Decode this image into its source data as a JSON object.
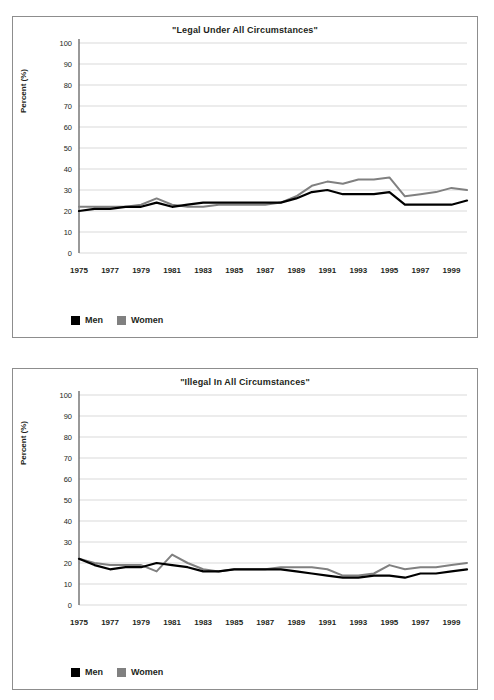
{
  "figure": {
    "panels": [
      {
        "id": "legal",
        "title": "\"Legal Under All Circumstances\"",
        "ylabel": "Percent (%)",
        "legend": [
          {
            "name": "Men",
            "color": "#000000"
          },
          {
            "name": "Women",
            "color": "#808080"
          }
        ],
        "yticks": [
          "0",
          "10",
          "20",
          "30",
          "40",
          "50",
          "60",
          "70",
          "80",
          "90",
          "100"
        ],
        "xticks": [
          "1975",
          "1977",
          "1979",
          "1981",
          "1983",
          "1985",
          "1987",
          "1989",
          "1991",
          "1993",
          "1995",
          "1997",
          "1999"
        ]
      },
      {
        "id": "illegal",
        "title": "\"Illegal In All Circumstances\"",
        "ylabel": "Percent (%)",
        "legend": [
          {
            "name": "Men",
            "color": "#000000"
          },
          {
            "name": "Women",
            "color": "#808080"
          }
        ],
        "yticks": [
          "0",
          "10",
          "20",
          "30",
          "40",
          "50",
          "60",
          "70",
          "80",
          "90",
          "100"
        ],
        "xticks": [
          "1975",
          "1977",
          "1979",
          "1981",
          "1983",
          "1985",
          "1987",
          "1989",
          "1991",
          "1993",
          "1995",
          "1997",
          "1999"
        ]
      }
    ]
  },
  "chart_data": [
    {
      "type": "line",
      "title": "\"Legal Under All Circumstances\"",
      "xlabel": "",
      "ylabel": "Percent (%)",
      "ylim": [
        0,
        100
      ],
      "ytick_step": 10,
      "grid": true,
      "legend_position": "bottom-left",
      "x": [
        1975,
        1976,
        1977,
        1978,
        1979,
        1980,
        1981,
        1982,
        1983,
        1984,
        1985,
        1986,
        1987,
        1988,
        1989,
        1990,
        1991,
        1992,
        1993,
        1994,
        1995,
        1996,
        1997,
        1998,
        1999,
        2000
      ],
      "xtick_labels": [
        "1975",
        "1977",
        "1979",
        "1981",
        "1983",
        "1985",
        "1987",
        "1989",
        "1991",
        "1993",
        "1995",
        "1997",
        "1999"
      ],
      "series": [
        {
          "name": "Men",
          "color": "#000000",
          "values": [
            20,
            21,
            21,
            22,
            22,
            24,
            22,
            23,
            24,
            24,
            24,
            24,
            24,
            24,
            26,
            29,
            30,
            28,
            28,
            28,
            29,
            23,
            23,
            23,
            23,
            25
          ]
        },
        {
          "name": "Women",
          "color": "#808080",
          "values": [
            22,
            22,
            22,
            22,
            23,
            26,
            23,
            22,
            22,
            23,
            23,
            23,
            23,
            24,
            27,
            32,
            34,
            33,
            35,
            35,
            36,
            27,
            28,
            29,
            31,
            30
          ]
        }
      ]
    },
    {
      "type": "line",
      "title": "\"Illegal In All Circumstances\"",
      "xlabel": "",
      "ylabel": "Percent (%)",
      "ylim": [
        0,
        100
      ],
      "ytick_step": 10,
      "grid": true,
      "legend_position": "bottom-left",
      "x": [
        1975,
        1976,
        1977,
        1978,
        1979,
        1980,
        1981,
        1982,
        1983,
        1984,
        1985,
        1986,
        1987,
        1988,
        1989,
        1990,
        1991,
        1992,
        1993,
        1994,
        1995,
        1996,
        1997,
        1998,
        1999,
        2000
      ],
      "xtick_labels": [
        "1975",
        "1977",
        "1979",
        "1981",
        "1983",
        "1985",
        "1987",
        "1989",
        "1991",
        "1993",
        "1995",
        "1997",
        "1999"
      ],
      "series": [
        {
          "name": "Men",
          "color": "#000000",
          "values": [
            22,
            19,
            17,
            18,
            18,
            20,
            19,
            18,
            16,
            16,
            17,
            17,
            17,
            17,
            16,
            15,
            14,
            13,
            13,
            14,
            14,
            13,
            15,
            15,
            16,
            17
          ]
        },
        {
          "name": "Women",
          "color": "#808080",
          "values": [
            22,
            20,
            19,
            19,
            19,
            16,
            24,
            20,
            17,
            16,
            17,
            17,
            17,
            18,
            18,
            18,
            17,
            14,
            14,
            15,
            19,
            17,
            18,
            18,
            19,
            20
          ]
        }
      ]
    }
  ]
}
